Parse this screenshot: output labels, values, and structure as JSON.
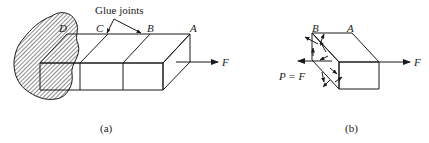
{
  "figure_a": {
    "caption": "(a)",
    "annotation": "Glue joints",
    "labels": {
      "A": "A",
      "B": "B",
      "C": "C",
      "D": "D",
      "force": "F"
    }
  },
  "figure_b": {
    "caption": "(b)",
    "labels": {
      "A": "A",
      "B": "B",
      "force": "F",
      "reaction": "P = F"
    }
  },
  "colors": {
    "ink": "#1a1a1a",
    "background": "#ffffff"
  }
}
